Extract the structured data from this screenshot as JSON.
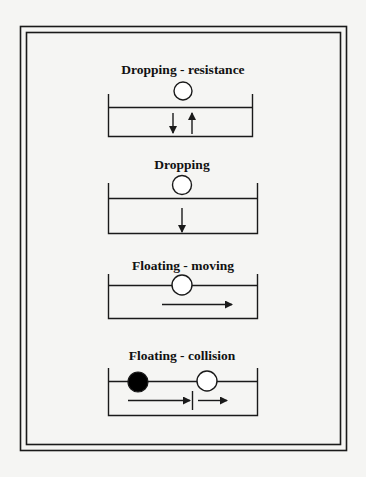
{
  "colors": {
    "background": "#f5f5f3",
    "stroke": "#1a1a1a",
    "filled_ball": "#000000",
    "hollow_ball": "#ffffff"
  },
  "panels": [
    {
      "title": "Dropping - resistance",
      "ball": "hollow",
      "ball_position": "above-surface",
      "arrows": [
        "down",
        "up"
      ]
    },
    {
      "title": "Dropping",
      "ball": "hollow",
      "ball_position": "above-surface",
      "arrows": [
        "down"
      ]
    },
    {
      "title": "Floating - moving",
      "ball": "hollow",
      "ball_position": "on-surface",
      "arrows": [
        "right"
      ]
    },
    {
      "title": "Floating - collision",
      "balls": [
        "filled",
        "hollow"
      ],
      "ball_position": "on-surface",
      "arrows": [
        "right",
        "impact-line",
        "right"
      ]
    }
  ]
}
